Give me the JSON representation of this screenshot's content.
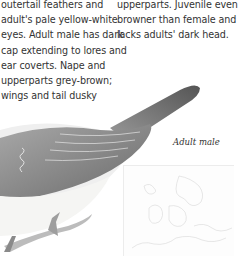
{
  "left_column": {
    "lines": [
      "outertail feathers and",
      "adult's pale yellow-white",
      "eyes. Adult male has dark",
      "cap extending to lores and",
      "ear coverts. Nape and",
      "upperparts grey-brown;",
      "wings and tail dusky"
    ]
  },
  "right_column": {
    "lines": [
      "upperparts. Juvenile even",
      "browner than female and",
      "lacks adults' dark head."
    ]
  },
  "illustration": {
    "caption": "Adult male",
    "subject": "bird-illustration"
  },
  "map": {
    "subject": "range-map"
  }
}
